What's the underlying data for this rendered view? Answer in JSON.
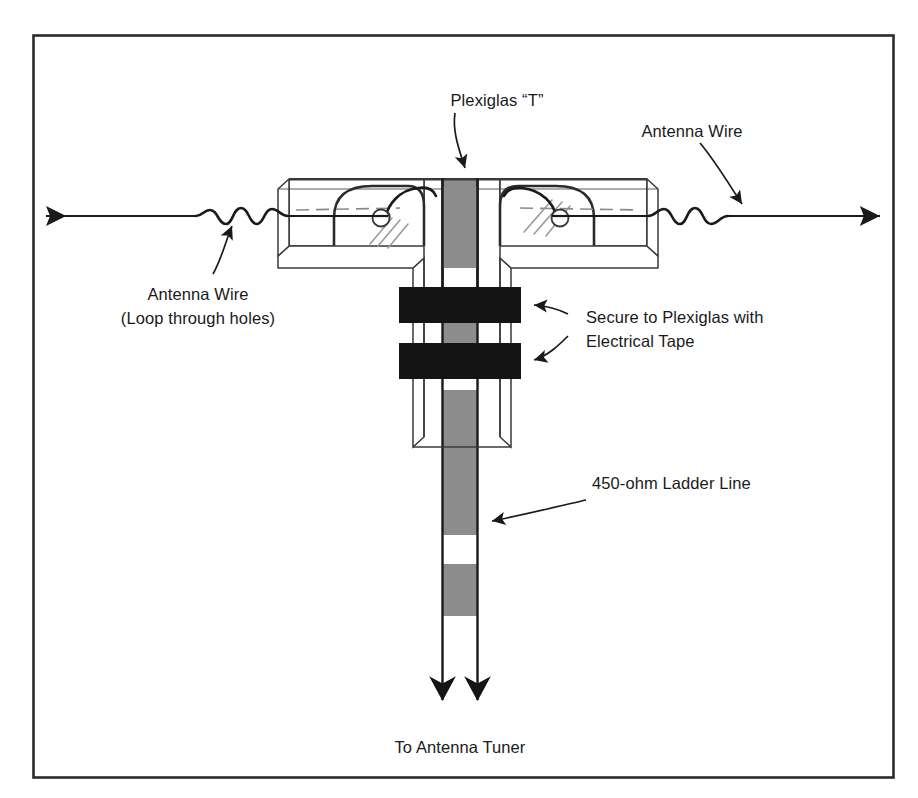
{
  "figure": {
    "background_color": "#ffffff",
    "border_color": "#2b2b2b",
    "ink_color": "#1a1a1a",
    "window_gray": "#8c8c8c",
    "tape_black": "#141414",
    "plexiglas_fill": "#ffffff"
  },
  "labels": {
    "plexiglas_t": "Plexiglas “T”",
    "antenna_wire_right": "Antenna Wire",
    "antenna_wire_left_line1": "Antenna Wire",
    "antenna_wire_left_line2": "(Loop through holes)",
    "secure_tape_line1": "Secure to Plexiglas with",
    "secure_tape_line2": "Electrical Tape",
    "ladder_line": "450-ohm Ladder Line",
    "to_tuner": "To Antenna Tuner"
  },
  "components": {
    "antenna_wire": {
      "name": "Antenna Wire",
      "y": 216,
      "left_arrow_x": 40,
      "right_arrow_x": 886,
      "coil_turns": 4
    },
    "plexiglas_t": {
      "name": "Plexiglas T",
      "crossbar_left": 288,
      "crossbar_right": 648,
      "crossbar_top": 178,
      "crossbar_bottom": 252,
      "stem_left": 424,
      "stem_right": 500,
      "stem_bottom": 447,
      "hole_left_x": 385,
      "hole_right_x": 555,
      "hole_y": 216,
      "hole_radius": 8
    },
    "ladder_line": {
      "name": "450-ohm Ladder Line",
      "impedance_ohms": 450,
      "left_conductor_x": 442,
      "right_conductor_x": 478,
      "top_y": 178,
      "bottom_y": 712,
      "window_color": "#8c8c8c",
      "windows": [
        {
          "top": 178,
          "bottom": 268
        },
        {
          "top": 300,
          "bottom": 345
        },
        {
          "top": 390,
          "bottom": 437
        },
        {
          "top": 437,
          "bottom": 480
        },
        {
          "top": 480,
          "bottom": 534
        },
        {
          "top": 564,
          "bottom": 616
        }
      ]
    },
    "electrical_tape": {
      "name": "Electrical Tape wraps",
      "count": 2,
      "color": "#141414",
      "bands": [
        {
          "left": 399,
          "right": 521,
          "top": 287,
          "bottom": 322
        },
        {
          "left": 399,
          "right": 521,
          "top": 343,
          "bottom": 378
        }
      ]
    }
  },
  "frame": {
    "left": 33,
    "top": 35,
    "right": 894,
    "bottom": 778
  }
}
